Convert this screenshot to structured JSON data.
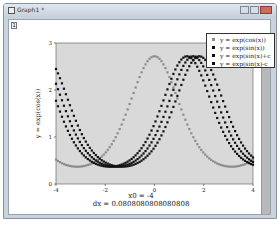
{
  "window": {
    "title": "Graph1 *",
    "layer_tab": "1",
    "controls": [
      "minimize",
      "maximize",
      "close"
    ]
  },
  "plot": {
    "y_axis_label": "y = exp(cos(x))",
    "x_ticks": [
      "-4",
      "-2",
      "0",
      "2",
      "4"
    ],
    "y_ticks": [
      "0",
      "1",
      "2",
      "3"
    ],
    "background": "#d9d9d9"
  },
  "annotations": {
    "x0": "x0 = -4",
    "dx": "dx = 0.0808080808080808"
  },
  "legend": {
    "items": [
      {
        "label": "y = exp(cos(x))",
        "color": "#8c8c8c"
      },
      {
        "label": "y = exp(sin(x))",
        "color": "#111111"
      },
      {
        "label": "y = exp(sin(x)+c",
        "color": "#111111"
      },
      {
        "label": "y = exp(sin(x)-c",
        "color": "#111111"
      }
    ]
  },
  "chart_data": {
    "type": "scatter",
    "title": "",
    "xlabel": "",
    "ylabel": "y = exp(cos(x))",
    "xlim": [
      -4,
      4
    ],
    "ylim": [
      0,
      3
    ],
    "x_start": -4,
    "dx": 0.0808080808080808,
    "num_points": 100,
    "grid": false,
    "legend_position": "top-right",
    "series": [
      {
        "name": "y = exp(cos(x))",
        "formula": "exp(cos(x))",
        "color": "#8c8c8c",
        "peak": {
          "x": 0,
          "y": 2.718
        },
        "min": 0.368
      },
      {
        "name": "y = exp(sin(x))",
        "formula": "exp(sin(x))",
        "color": "#111111",
        "peak": {
          "x": 1.571,
          "y": 2.718
        },
        "min": 0.368
      },
      {
        "name": "y = exp(sin(x)+c",
        "formula": "exp(sin(x+0.25))",
        "color": "#111111",
        "peak": {
          "x": 1.32,
          "y": 2.718
        }
      },
      {
        "name": "y = exp(sin(x)-c",
        "formula": "exp(sin(x-0.25))",
        "color": "#111111",
        "peak": {
          "x": 1.82,
          "y": 2.718
        }
      }
    ]
  }
}
